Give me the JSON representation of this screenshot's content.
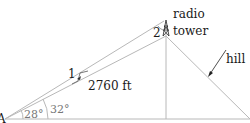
{
  "diagram": {
    "labels": {
      "vertex": "A",
      "angle_lower": "28°",
      "angle_upper": "32°",
      "distance": "2760 ft",
      "angle_marker_1": "1",
      "angle_marker_2": "2",
      "tower_line1": "radio",
      "tower_line2": "tower",
      "hill": "hill"
    },
    "colors": {
      "line": "#b8b8b8",
      "text": "#1a1a1a",
      "angle_text": "#777777"
    }
  }
}
